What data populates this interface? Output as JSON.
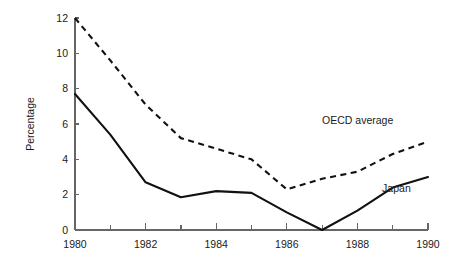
{
  "chart_data": {
    "type": "line",
    "title": "",
    "xlabel": "",
    "ylabel": "Percentage",
    "xlim": [
      1980,
      1990
    ],
    "ylim": [
      0,
      12
    ],
    "grid": false,
    "legend_position": "inline-annotation",
    "x": [
      1980,
      1981,
      1982,
      1983,
      1984,
      1985,
      1986,
      1987,
      1988,
      1989,
      1990
    ],
    "x_tick_labels": [
      "1980",
      "1982",
      "1984",
      "1986",
      "1988",
      "1990"
    ],
    "x_tick_values": [
      1980,
      1982,
      1984,
      1986,
      1988,
      1990
    ],
    "x_minor_tick_values": [
      1981,
      1983,
      1985,
      1987,
      1989
    ],
    "y_tick_labels": [
      "0",
      "2",
      "4",
      "6",
      "8",
      "10",
      "12"
    ],
    "y_tick_values": [
      0,
      2,
      4,
      6,
      8,
      10,
      12
    ],
    "series": [
      {
        "name": "OECD average",
        "style": "dashed",
        "label_text": "OECD average",
        "values": [
          12.0,
          9.6,
          7.1,
          5.2,
          4.6,
          4.0,
          2.3,
          2.9,
          3.3,
          4.3,
          5.0
        ]
      },
      {
        "name": "Japan",
        "style": "solid",
        "label_text": "Japan",
        "values": [
          7.7,
          5.4,
          2.7,
          1.85,
          2.2,
          2.1,
          1.0,
          0.0,
          1.1,
          2.4,
          3.0
        ]
      }
    ],
    "annotations": [
      {
        "text": "OECD average",
        "x": 1987.0,
        "y": 6.0
      },
      {
        "text": "Japan",
        "x": 1988.7,
        "y": 2.15
      }
    ]
  }
}
